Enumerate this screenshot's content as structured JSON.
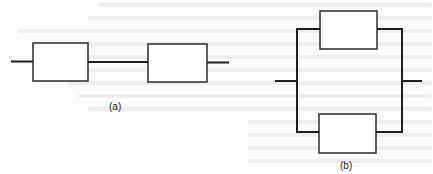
{
  "figure": {
    "subfigures": [
      {
        "id": "a",
        "label": "(a)",
        "type": "series",
        "blocks": 2,
        "description": "Two blocks connected in series"
      },
      {
        "id": "b",
        "label": "(b)",
        "type": "parallel",
        "blocks": 2,
        "description": "Two blocks connected in parallel"
      }
    ]
  },
  "colors": {
    "line": "#1e1e1e",
    "box_border": "#2a2a2a",
    "paper": "#fbfbfa",
    "bleed_text": "#ececec"
  }
}
